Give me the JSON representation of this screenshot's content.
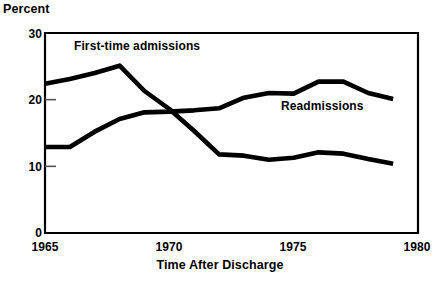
{
  "chart_data": {
    "type": "line",
    "title": "",
    "ylabel": "Percent",
    "xlabel": "Time After Discharge",
    "xlim": [
      1965,
      1980
    ],
    "ylim": [
      0,
      30
    ],
    "xticks": [
      1965,
      1970,
      1975,
      1980
    ],
    "yticks": [
      0,
      10,
      20,
      30
    ],
    "grid": false,
    "legend_position": "inline-annotations",
    "line_color": "#000000",
    "line_width_px": 4.6,
    "axis_color": "#000000",
    "background_color": "#ffffff",
    "x": [
      1965,
      1966,
      1967,
      1968,
      1969,
      1970,
      1971,
      1972,
      1973,
      1974,
      1975,
      1976,
      1977,
      1978,
      1979
    ],
    "series": [
      {
        "name": "First-time admissions",
        "values": [
          22.4,
          23.1,
          24.0,
          25.1,
          21.3,
          18.6,
          15.3,
          11.8,
          11.6,
          11.0,
          11.3,
          12.1,
          11.9,
          11.1,
          10.4
        ]
      },
      {
        "name": "Readmissions",
        "values": [
          12.9,
          12.9,
          15.2,
          17.1,
          18.1,
          18.2,
          18.4,
          18.7,
          20.3,
          21.0,
          20.9,
          22.7,
          22.7,
          21.0,
          20.1
        ]
      }
    ],
    "annotations": [
      {
        "text": "First-time admissions",
        "x": 1967.9,
        "y": 27.1
      },
      {
        "text": "Readmissions",
        "x": 1974.3,
        "y": 18.9
      }
    ]
  },
  "axis": {
    "y_tick_labels": [
      "30",
      "20",
      "10",
      "0"
    ],
    "x_tick_labels": [
      "1965",
      "1970",
      "1975",
      "1980"
    ],
    "y_axis_title": "Percent",
    "x_axis_title": "Time After Discharge"
  }
}
